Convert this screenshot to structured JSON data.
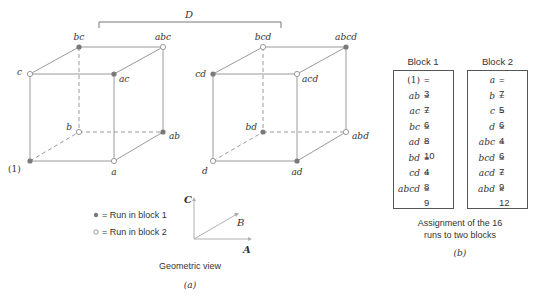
{
  "bracket_label": "D",
  "left_cube": {
    "vertices": [
      {
        "label": "(1)",
        "block": 1
      },
      {
        "label": "a",
        "block": 2
      },
      {
        "label": "b",
        "block": 2
      },
      {
        "label": "ab",
        "block": 1
      },
      {
        "label": "c",
        "block": 2
      },
      {
        "label": "ac",
        "block": 1
      },
      {
        "label": "bc",
        "block": 1
      },
      {
        "label": "abc",
        "block": 2
      }
    ]
  },
  "right_cube": {
    "vertices": [
      {
        "label": "d",
        "block": 2
      },
      {
        "label": "ad",
        "block": 1
      },
      {
        "label": "bd",
        "block": 1
      },
      {
        "label": "abd",
        "block": 2
      },
      {
        "label": "cd",
        "block": 1
      },
      {
        "label": "acd",
        "block": 2
      },
      {
        "label": "bcd",
        "block": 2
      },
      {
        "label": "abcd",
        "block": 1
      }
    ]
  },
  "legend": {
    "block1": "= Run in block 1",
    "block2": "= Run in block 2"
  },
  "axes": {
    "A": "A",
    "B": "B",
    "C": "C"
  },
  "panel_a": {
    "caption": "Geometric view",
    "tag": "(a)"
  },
  "panel_b": {
    "block1": {
      "title": "Block 1",
      "rows": [
        {
          "run": "(1)",
          "value": "= 3"
        },
        {
          "run": "ab",
          "value": "= 7"
        },
        {
          "run": "ac",
          "value": "= 6"
        },
        {
          "run": "bc",
          "value": "= 8"
        },
        {
          "run": "ad",
          "value": "= 10"
        },
        {
          "run": "bd",
          "value": "= 4"
        },
        {
          "run": "cd",
          "value": "= 8"
        },
        {
          "run": "abcd",
          "value": "= 9"
        }
      ]
    },
    "block2": {
      "title": "Block 2",
      "rows": [
        {
          "run": "a",
          "value": "= 7"
        },
        {
          "run": "b",
          "value": "= 5"
        },
        {
          "run": "c",
          "value": "= 6"
        },
        {
          "run": "d",
          "value": "= 4"
        },
        {
          "run": "abc",
          "value": "= 6"
        },
        {
          "run": "bcd",
          "value": "= 7"
        },
        {
          "run": "acd",
          "value": "= 9"
        },
        {
          "run": "abd",
          "value": "= 12"
        }
      ]
    },
    "caption_line1": "Assignment of the 16",
    "caption_line2": "runs to two blocks",
    "tag": "(b)"
  },
  "colors": {
    "edge": "#9a9a9a",
    "filled_dot": "#7a7a7a",
    "open_dot_stroke": "#9a9a9a"
  }
}
